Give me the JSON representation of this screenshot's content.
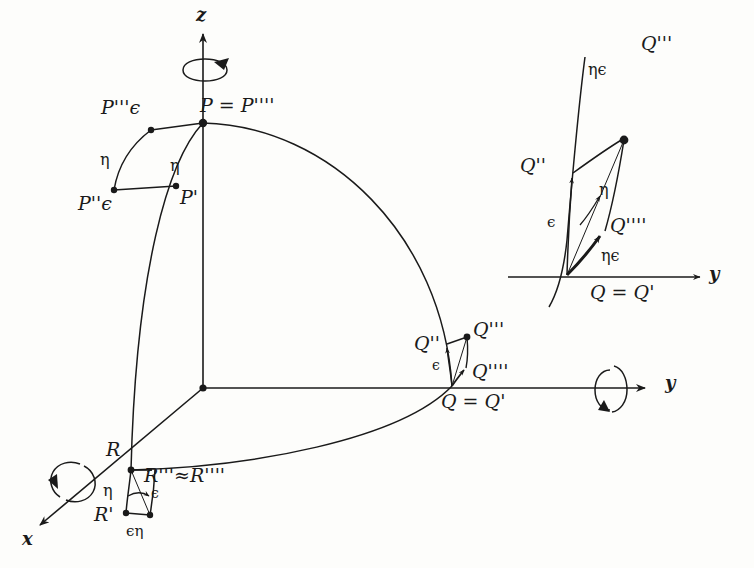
{
  "figure": {
    "background_color": "#fdfdfb",
    "ink_color": "#1a1a1a",
    "axes": {
      "z_label": "z",
      "y_label": "y",
      "x_label": "x",
      "origin_label": ""
    },
    "main": {
      "points": {
        "P": "P = P''''",
        "P3eps": "P'''ϵ",
        "P2eps": "P''ϵ",
        "Pprime": "P'",
        "Q": "Q = Q'",
        "Q2": "Q''",
        "Q3": "Q'''",
        "Q4": "Q''''",
        "R": "R",
        "Rprime": "R'",
        "R34": "R'''≈R''''"
      },
      "arc_labels": {
        "eta_left": "η",
        "eta_right": "η",
        "eta_R": "η",
        "eps_R": "ϵ",
        "epseta_R": "ϵη",
        "eps_Q": "ϵ"
      }
    },
    "inset": {
      "points": {
        "Q": "Q = Q'",
        "Q2": "Q''",
        "Q3": "Q'''",
        "Q4": "Q''''"
      },
      "arc_labels": {
        "eta_eps_top": "ηϵ",
        "eta_mid": "η",
        "eps_left": "ϵ",
        "eta_eps_bottom": "ηϵ"
      },
      "axis_label": "y"
    }
  }
}
